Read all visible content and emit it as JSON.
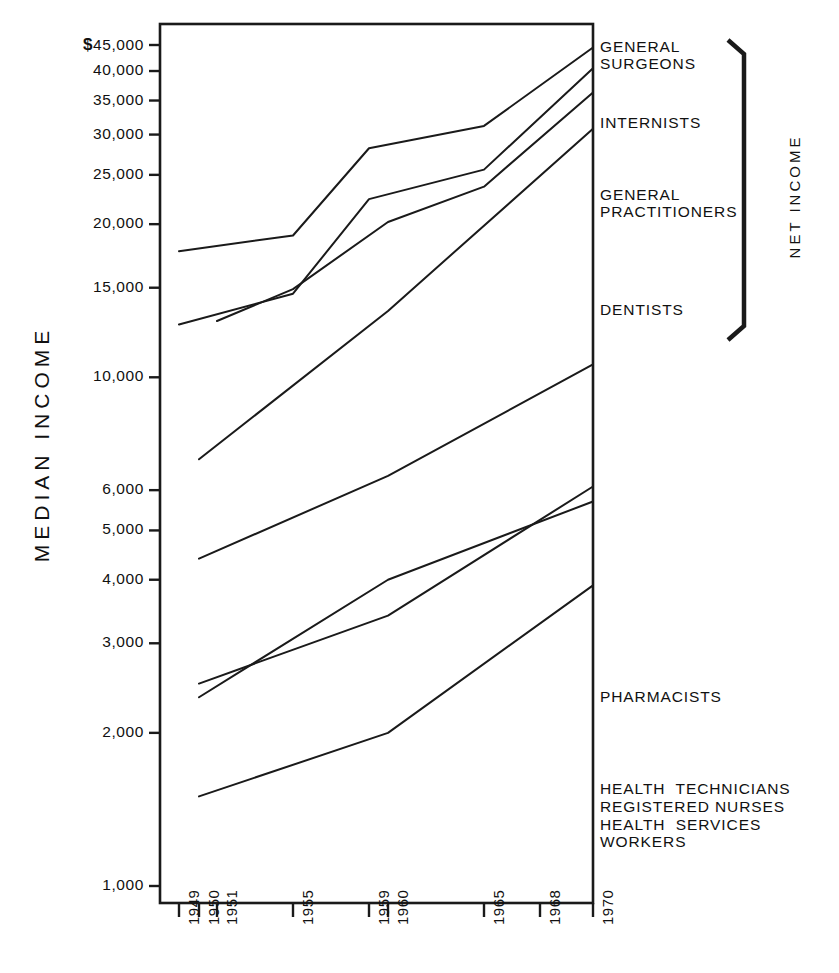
{
  "chart_data": {
    "type": "line",
    "title": "",
    "xlabel": "",
    "ylabel": "MEDIAN INCOME",
    "yscale": "log",
    "ylim": [
      1000,
      48000
    ],
    "grid": false,
    "legend_position": "right-inline-labels",
    "x_ticks": [
      "1949",
      "1950",
      "1951",
      "1955",
      "1959",
      "1960",
      "1965",
      "1968",
      "1970"
    ],
    "x_tick_values": [
      1949,
      1950,
      1951,
      1955,
      1959,
      1960,
      1965,
      1968,
      1970
    ],
    "y_ticks": [
      "$45,000",
      "40,000",
      "35,000",
      "30,000",
      "25,000",
      "20,000",
      "15,000",
      "10,000",
      "6,000",
      "5,000",
      "4,000",
      "3,000",
      "2,000",
      "1,000"
    ],
    "y_tick_values": [
      45000,
      40000,
      35000,
      30000,
      25000,
      20000,
      15000,
      10000,
      6000,
      5000,
      4000,
      3000,
      2000,
      1000
    ],
    "series": [
      {
        "name": "GENERAL SURGEONS",
        "label_lines": [
          "GENERAL",
          "SURGEONS"
        ],
        "x": [
          1949,
          1955,
          1959,
          1965,
          1970
        ],
        "values": [
          17700,
          19000,
          28200,
          31200,
          44500
        ]
      },
      {
        "name": "INTERNISTS",
        "label_lines": [
          "INTERNISTS"
        ],
        "x": [
          1949,
          1955,
          1959,
          1965,
          1970
        ],
        "values": [
          12700,
          14600,
          22400,
          25600,
          40500
        ]
      },
      {
        "name": "GENERAL PRACTITIONERS",
        "label_lines": [
          "GENERAL",
          "PRACTITIONERS"
        ],
        "x": [
          1951,
          1955,
          1960,
          1965,
          1970
        ],
        "values": [
          12900,
          14900,
          20200,
          23700,
          36300
        ]
      },
      {
        "name": "DENTISTS",
        "label_lines": [
          "DENTISTS"
        ],
        "x": [
          1950,
          1960,
          1970
        ],
        "values": [
          6900,
          13500,
          30800
        ]
      },
      {
        "name": "PHARMACISTS",
        "label_lines": [
          "PHARMACISTS"
        ],
        "x": [
          1950,
          1960,
          1970
        ],
        "values": [
          4400,
          6400,
          10600
        ]
      },
      {
        "name": "HEALTH TECHNICIANS",
        "label_lines": [
          "HEALTH  TECHNICIANS"
        ],
        "x": [
          1950,
          1960,
          1970
        ],
        "values": [
          2500,
          3400,
          6100
        ]
      },
      {
        "name": "REGISTERED NURSES",
        "label_lines": [
          "REGISTERED NURSES"
        ],
        "x": [
          1950,
          1960,
          1970
        ],
        "values": [
          2350,
          4000,
          5700
        ]
      },
      {
        "name": "HEALTH SERVICES WORKERS",
        "label_lines": [
          "HEALTH  SERVICES",
          "WORKERS"
        ],
        "x": [
          1950,
          1960,
          1970
        ],
        "values": [
          1500,
          2000,
          3900
        ]
      }
    ],
    "annotations": [
      {
        "name": "net-income-bracket",
        "text": "NET  INCOME",
        "covers": [
          "GENERAL SURGEONS",
          "INTERNISTS",
          "GENERAL PRACTITIONERS",
          "DENTISTS"
        ]
      }
    ],
    "colors": {
      "line": "#1a1a1a",
      "axis": "#1a1a1a",
      "background": "#ffffff"
    }
  },
  "axis": {
    "y_title": "MEDIAN INCOME"
  }
}
